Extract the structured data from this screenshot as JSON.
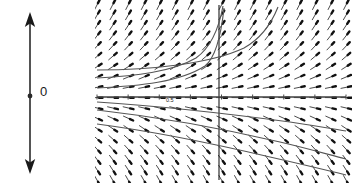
{
  "figure": {
    "type": "phase-line-and-direction-field",
    "background": "#ffffff",
    "ink": "#1a1a1a",
    "curve_color": "#555555",
    "width": 352,
    "height": 183
  },
  "phase_line": {
    "name": "phase-line",
    "orientation": "vertical",
    "x": 30,
    "y_top": 14,
    "y_bottom": 172,
    "top_arrow": "arrow-up",
    "bottom_arrow": "arrow-down",
    "equilibrium": {
      "label": "0",
      "value": 0,
      "y": 96,
      "dot_radius": 2.4,
      "stability": "unstable",
      "flow_above": "up",
      "flow_below": "down"
    }
  },
  "direction_field": {
    "name": "direction-field",
    "plot_left": 97,
    "plot_right": 346,
    "plot_top": 5,
    "plot_bottom": 180,
    "x_axis_y": 97,
    "y_axis_x": 219,
    "grid": false,
    "axis_labels": {
      "x": "",
      "y": ""
    },
    "x_tick_label": "0.5",
    "x_tick_label_x": 166,
    "x_tick_label_y": 102,
    "arrow_columns": 17,
    "arrow_rows": 18,
    "arrow_spacing_x": 14.6,
    "arrow_spacing_y": 9.7,
    "arrow_length": 11,
    "slope_note": "arrows tilt up-right above the horizontal axis, lie flat along it, and tilt down-right below it",
    "solution_curves": [
      {
        "id": "curve-upper-asymptote-1",
        "d": "M 97,88 C 140,86 180,82 205,66 C 215,58 221,36 224,8"
      },
      {
        "id": "curve-upper-asymptote-2",
        "d": "M 97,78 C 135,76 172,72 196,58 C 210,48 219,28 223,6"
      },
      {
        "id": "curve-upper-asymptote-3",
        "d": "M 97,70 C 150,70 210,64 244,48 C 262,38 272,22 278,7"
      },
      {
        "id": "curve-equilibrium-line",
        "d": "M 97,97 L 346,97"
      },
      {
        "id": "curve-lower-1",
        "d": "M 97,110 C 150,116 220,128 280,142 C 310,149 330,155 346,159"
      },
      {
        "id": "curve-lower-2",
        "d": "M 97,124 C 150,131 215,144 270,157 C 305,165 330,171 346,175"
      },
      {
        "id": "curve-lower-3",
        "d": "M 97,102 C 160,106 230,114 290,122 C 318,126 334,129 346,131"
      }
    ]
  }
}
